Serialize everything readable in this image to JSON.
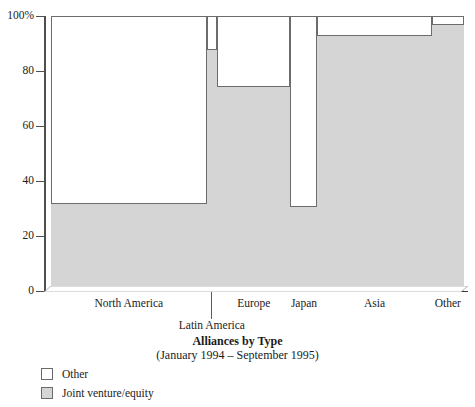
{
  "chart_data": {
    "type": "bar",
    "title": "Alliances by Type",
    "subtitle": "(January 1994 – September 1995)",
    "xlabel": "",
    "ylabel": "",
    "ylim": [
      0,
      100
    ],
    "grid": false,
    "stacked": true,
    "legend_position": "bottom-left",
    "categories": [
      "North America",
      "Latin America",
      "Europe",
      "Japan",
      "Asia",
      "Other"
    ],
    "category_widths_pct": [
      37.5,
      2.5,
      17.7,
      6.5,
      27.5,
      7.8
    ],
    "yticks": [
      0,
      20,
      40,
      60,
      80,
      100
    ],
    "ytick_labels": [
      "0",
      "20",
      "40",
      "60",
      "80",
      "100%"
    ],
    "series": [
      {
        "name": "Joint venture/equity",
        "color": "#d5d5d5",
        "values": [
          32,
          88,
          74.5,
          31,
          93,
          97
        ]
      },
      {
        "name": "Other",
        "color": "#ffffff",
        "values": [
          68,
          12,
          25.5,
          69,
          7,
          3
        ]
      }
    ]
  },
  "axis": {
    "ticks": [
      {
        "label": "100%",
        "value": 100
      },
      {
        "label": "80",
        "value": 80
      },
      {
        "label": "60",
        "value": 60
      },
      {
        "label": "40",
        "value": 40
      },
      {
        "label": "20",
        "value": 20
      },
      {
        "label": "0",
        "value": 0
      }
    ]
  },
  "bars": [
    {
      "name": "north-america",
      "label": "North America",
      "fill_pct": 32
    },
    {
      "name": "latin-america",
      "label": "Latin America",
      "fill_pct": 88
    },
    {
      "name": "europe",
      "label": "Europe",
      "fill_pct": 74.5
    },
    {
      "name": "japan",
      "label": "Japan",
      "fill_pct": 31
    },
    {
      "name": "asia",
      "label": "Asia",
      "fill_pct": 93
    },
    {
      "name": "other",
      "label": "Other",
      "fill_pct": 97
    }
  ],
  "title": {
    "main": "Alliances by Type",
    "sub": "(January 1994 – September 1995)"
  },
  "legend": {
    "items": [
      {
        "label": "Other",
        "swatch": "white"
      },
      {
        "label": "Joint venture/equity",
        "swatch": "gray"
      }
    ]
  }
}
